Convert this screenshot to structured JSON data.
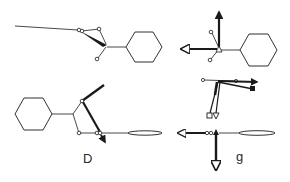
{
  "figure": {
    "type": "molecular-diagram",
    "background": "#ffffff",
    "ink_color": "#1a1a1a",
    "panels": [
      {
        "id": "top-left",
        "description": "Cyclohexyl group attached to tetrahedral center with long chain to left; thick bond wedge and small open-circle atoms",
        "label": ""
      },
      {
        "id": "top-right",
        "description": "Cyclohexyl group at right; vector arrows up and left from central atom (triangle marker); two open-circle atoms",
        "label": ""
      },
      {
        "id": "bottom-left",
        "description": "Cyclohexyl group at left; ring-like linkage with thick diagonal bond and small arrow; chain to right ending in elongated ellipse",
        "label": "D"
      },
      {
        "id": "bottom-right",
        "description": "Vector arrows: right-pointing pair, down-pointing pair ending in square and triangle markers; horizontal chain with ellipse; arrow down labelled g",
        "label": "g"
      }
    ]
  }
}
